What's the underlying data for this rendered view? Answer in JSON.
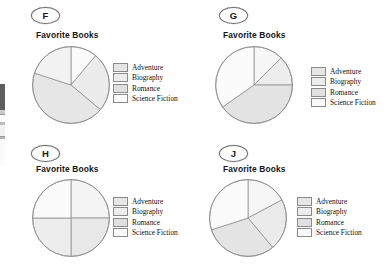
{
  "figure": {
    "kind": "multiple-choice-pie-chart-options",
    "background_color": "#ffffff",
    "slice_fill_light": "#fbfbfb",
    "slice_fill_mid": "#efefef",
    "slice_fill_dark": "#e3e3e3",
    "slice_outline_color": "#8e8e8e"
  },
  "legend_labels": [
    "Adventure",
    "Biography",
    "Romance",
    "Science Fiction"
  ],
  "options": [
    {
      "id": "F",
      "badge_label": "F",
      "title": "Favorite Books",
      "legend": [
        {
          "label": "Adventure",
          "swatch_color": "#e6e6e6"
        },
        {
          "label": "Biography",
          "swatch_color": "#ececec"
        },
        {
          "label": "Romance",
          "swatch_color": "#e0e0e0"
        },
        {
          "label": "Science Fiction",
          "swatch_color": "#fafafa"
        }
      ]
    },
    {
      "id": "G",
      "badge_label": "G",
      "title": "Favorite Books",
      "legend": [
        {
          "label": "Adventure",
          "swatch_color": "#e6e6e6"
        },
        {
          "label": "Biography",
          "swatch_color": "#ececec"
        },
        {
          "label": "Romance",
          "swatch_color": "#e0e0e0"
        },
        {
          "label": "Science Fiction",
          "swatch_color": "#fafafa"
        }
      ]
    },
    {
      "id": "H",
      "badge_label": "H",
      "title": "Favorite Books",
      "legend": [
        {
          "label": "Adventure",
          "swatch_color": "#e6e6e6"
        },
        {
          "label": "Biography",
          "swatch_color": "#ececec"
        },
        {
          "label": "Romance",
          "swatch_color": "#e0e0e0"
        },
        {
          "label": "Science Fiction",
          "swatch_color": "#fafafa"
        }
      ]
    },
    {
      "id": "J",
      "badge_label": "J",
      "title": "Favorite Books",
      "legend": [
        {
          "label": "Adventure",
          "swatch_color": "#e6e6e6"
        },
        {
          "label": "Biography",
          "swatch_color": "#ececec"
        },
        {
          "label": "Romance",
          "swatch_color": "#e0e0e0"
        },
        {
          "label": "Science Fiction",
          "swatch_color": "#fafafa"
        }
      ]
    }
  ],
  "chart_data": [
    {
      "type": "pie",
      "option_id": "F",
      "title": "Favorite Books",
      "categories": [
        "Science Fiction",
        "Adventure",
        "Romance",
        "Biography"
      ],
      "values": [
        11,
        25,
        44,
        20
      ],
      "units": "percent",
      "start_angle_deg": 0,
      "direction": "clockwise",
      "slices": [
        {
          "label": "Science Fiction",
          "percent": 11,
          "start_deg": 0,
          "end_deg": 40,
          "fill": "#fbfbfb"
        },
        {
          "label": "Adventure",
          "percent": 25,
          "start_deg": 40,
          "end_deg": 130,
          "fill": "#ececec"
        },
        {
          "label": "Romance",
          "percent": 44,
          "start_deg": 130,
          "end_deg": 288,
          "fill": "#e6e6e6"
        },
        {
          "label": "Biography",
          "percent": 20,
          "start_deg": 288,
          "end_deg": 360,
          "fill": "#f2f2f2"
        }
      ],
      "legend_position": "right",
      "grid": false
    },
    {
      "type": "pie",
      "option_id": "G",
      "title": "Favorite Books",
      "categories": [
        "Science Fiction",
        "Adventure",
        "Romance",
        "Biography"
      ],
      "values": [
        12,
        13,
        40,
        35
      ],
      "units": "percent",
      "start_angle_deg": 0,
      "direction": "clockwise",
      "slices": [
        {
          "label": "Science Fiction",
          "percent": 12,
          "start_deg": 0,
          "end_deg": 45,
          "fill": "#f7f7f7"
        },
        {
          "label": "Adventure",
          "percent": 13,
          "start_deg": 45,
          "end_deg": 90,
          "fill": "#ededed"
        },
        {
          "label": "Romance",
          "percent": 40,
          "start_deg": 90,
          "end_deg": 235,
          "fill": "#e3e3e3"
        },
        {
          "label": "Biography",
          "percent": 35,
          "start_deg": 235,
          "end_deg": 360,
          "fill": "#fbfbfb"
        }
      ],
      "legend_position": "right",
      "grid": false
    },
    {
      "type": "pie",
      "option_id": "H",
      "title": "Favorite Books",
      "categories": [
        "Adventure",
        "Biography",
        "Romance",
        "Science Fiction"
      ],
      "values": [
        25,
        25,
        25,
        25
      ],
      "units": "percent",
      "start_angle_deg": 0,
      "direction": "clockwise",
      "slices": [
        {
          "label": "Adventure",
          "percent": 25,
          "start_deg": 0,
          "end_deg": 90,
          "fill": "#f4f4f4"
        },
        {
          "label": "Biography",
          "percent": 25,
          "start_deg": 90,
          "end_deg": 180,
          "fill": "#e8e8e8"
        },
        {
          "label": "Romance",
          "percent": 25,
          "start_deg": 180,
          "end_deg": 270,
          "fill": "#ededed"
        },
        {
          "label": "Science Fiction",
          "percent": 25,
          "start_deg": 270,
          "end_deg": 360,
          "fill": "#fbfbfb"
        }
      ],
      "legend_position": "right",
      "grid": false
    },
    {
      "type": "pie",
      "option_id": "J",
      "title": "Favorite Books",
      "categories": [
        "Science Fiction",
        "Adventure",
        "Romance",
        "Biography"
      ],
      "values": [
        17,
        22,
        31,
        30
      ],
      "units": "percent",
      "start_angle_deg": 0,
      "direction": "clockwise",
      "slices": [
        {
          "label": "Science Fiction",
          "percent": 17,
          "start_deg": 0,
          "end_deg": 62,
          "fill": "#f6f6f6"
        },
        {
          "label": "Adventure",
          "percent": 22,
          "start_deg": 62,
          "end_deg": 140,
          "fill": "#ebebeb"
        },
        {
          "label": "Romance",
          "percent": 31,
          "start_deg": 140,
          "end_deg": 252,
          "fill": "#e4e4e4"
        },
        {
          "label": "Biography",
          "percent": 30,
          "start_deg": 252,
          "end_deg": 360,
          "fill": "#fbfbfb"
        }
      ],
      "legend_position": "right",
      "grid": false
    }
  ]
}
